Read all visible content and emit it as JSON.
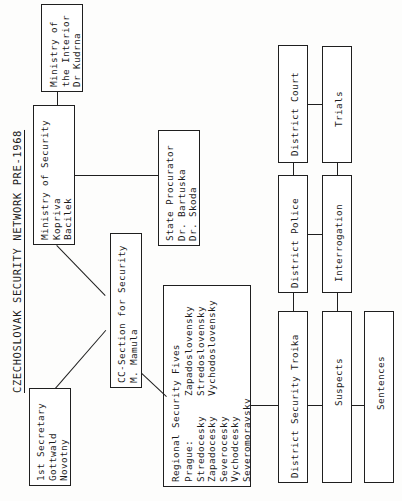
{
  "title": "CZECHOSLOVAK SECURITY NETWORK PRE-1968",
  "nodes": {
    "ministry_interior": "Ministry of\nthe Interior\nDr Kudrna",
    "ministry_security": "Ministry of Security\nKopriva\nBacilek",
    "state_procurator": "State Procurator\nDr. Bartuska\nDr. Skoda",
    "cc_section": "CC-Section for Security\nM. Mamula",
    "first_secretary": "1st Secretary\nGottwald\nNovotny",
    "regional_fives_heading": "Regional Security Fives",
    "regional_fives_col1": "Prague:\nStredocesky\nZapadocesky\nSeverocesky\nVychodcesky\nSeveromoravsky",
    "regional_fives_col2": "Zapadoslovensky\nStredoslovensky\nVychodoslovensky",
    "district_court": "District Court",
    "trials": "Trials",
    "district_police": "District Police",
    "interrogation": "Interrogation",
    "district_security_troika": "District Security Troika",
    "suspects": "Suspects",
    "sentences": "Sentences"
  },
  "colors": {
    "ink": "#1f1f1f",
    "paper": "#fdfdfc"
  }
}
